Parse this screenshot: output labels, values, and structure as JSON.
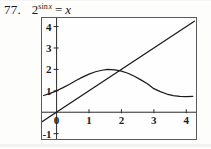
{
  "problem": {
    "number": "77.",
    "equation_plain": "2^(sin x) = x",
    "equation_parts": {
      "base": "2",
      "exponent_fn": "sin",
      "exponent_var": "x",
      "relation": "=",
      "right": "x"
    }
  },
  "chart_data": {
    "type": "line",
    "title": "",
    "xlabel": "",
    "ylabel": "",
    "xlim": [
      -0.45,
      4.3
    ],
    "ylim": [
      -1.25,
      4.4
    ],
    "grid": false,
    "legend": false,
    "xticks": [
      "0",
      "1",
      "2",
      "3",
      "4"
    ],
    "xtick_values": [
      0,
      1,
      2,
      3,
      4
    ],
    "yticks": [
      "-1",
      "1",
      "2",
      "3",
      "4"
    ],
    "ytick_values": [
      -1,
      1,
      2,
      3,
      4
    ],
    "origin_label": "0",
    "axis_color": "#2a2a2a",
    "curve_color": "#1b1b1b",
    "series": [
      {
        "name": "y = 2^(sin x)",
        "expression": "2**sin(x)",
        "points": [
          [
            -0.4,
            0.78
          ],
          [
            -0.2,
            0.88
          ],
          [
            0.0,
            1.0
          ],
          [
            0.2,
            1.15
          ],
          [
            0.4,
            1.31
          ],
          [
            0.6,
            1.48
          ],
          [
            0.8,
            1.64
          ],
          [
            1.0,
            1.78
          ],
          [
            1.2,
            1.89
          ],
          [
            1.4,
            1.96
          ],
          [
            1.5708,
            2.0
          ],
          [
            1.8,
            1.98
          ],
          [
            2.0,
            1.92
          ],
          [
            2.2,
            1.82
          ],
          [
            2.4,
            1.68
          ],
          [
            2.6,
            1.51
          ],
          [
            2.8,
            1.33
          ],
          [
            3.0,
            1.1
          ],
          [
            3.2,
            0.96
          ],
          [
            3.4,
            0.85
          ],
          [
            3.6,
            0.78
          ],
          [
            3.8,
            0.74
          ],
          [
            4.0,
            0.73
          ],
          [
            4.2,
            0.74
          ]
        ]
      },
      {
        "name": "y = x",
        "expression": "x",
        "points": [
          [
            -0.62,
            -0.62
          ],
          [
            4.25,
            4.25
          ]
        ]
      }
    ],
    "intersections": [
      [
        1.92,
        1.92
      ]
    ],
    "annotations": []
  }
}
